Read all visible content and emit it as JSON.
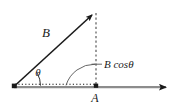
{
  "figure": {
    "type": "vector-decomposition-diagram",
    "background_color": "#ffffff",
    "stroke_color": "#1a1a1a",
    "baseline_color": "#8c8c8c",
    "labels": {
      "vector_b": "B",
      "vector_a": "A",
      "angle": "θ",
      "projection": "B cosθ"
    },
    "geometry": {
      "origin": {
        "x": 14,
        "y": 86
      },
      "vector_b_tip": {
        "x": 96,
        "y": 11
      },
      "point_a": {
        "x": 96,
        "y": 86
      },
      "axis_arrow_tip": {
        "x": 171,
        "y": 86
      },
      "angle_arc_radius": 26,
      "projection_arc_radius": 29
    },
    "label_positions": {
      "vector_b": {
        "x": 46,
        "y": 37
      },
      "vector_a": {
        "x": 92,
        "y": 102
      },
      "angle": {
        "x": 38,
        "y": 76
      },
      "projection": {
        "x": 104,
        "y": 68
      }
    }
  }
}
